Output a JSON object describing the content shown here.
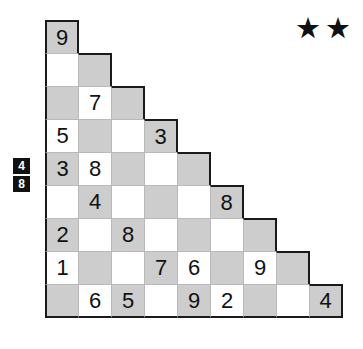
{
  "puzzle": {
    "type": "triangular-number-grid",
    "shape": "right-triangle-staircase",
    "rows": 9,
    "difficulty": {
      "stars_count": 2,
      "star_glyph": "★"
    },
    "clue": {
      "label": "left-edge-clue",
      "values": [
        "4",
        "8"
      ]
    },
    "colors": {
      "shaded_cell": "#cdcdcd",
      "empty_cell": "#ffffff",
      "grid_line": "#b9b9b9",
      "outline": "#1a1a1a",
      "digit": "#111111",
      "clue_background": "#111111",
      "clue_text": "#ffffff"
    },
    "grid": [
      [
        {
          "v": "9",
          "s": true
        }
      ],
      [
        {
          "v": "",
          "s": false
        },
        {
          "v": "",
          "s": true
        }
      ],
      [
        {
          "v": "",
          "s": true
        },
        {
          "v": "7",
          "s": false
        },
        {
          "v": "",
          "s": true
        }
      ],
      [
        {
          "v": "5",
          "s": false
        },
        {
          "v": "",
          "s": true
        },
        {
          "v": "",
          "s": false
        },
        {
          "v": "3",
          "s": true
        }
      ],
      [
        {
          "v": "3",
          "s": true
        },
        {
          "v": "8",
          "s": false
        },
        {
          "v": "",
          "s": true
        },
        {
          "v": "",
          "s": false
        },
        {
          "v": "",
          "s": true
        }
      ],
      [
        {
          "v": "",
          "s": false
        },
        {
          "v": "4",
          "s": true
        },
        {
          "v": "",
          "s": false
        },
        {
          "v": "",
          "s": true
        },
        {
          "v": "",
          "s": false
        },
        {
          "v": "8",
          "s": true
        }
      ],
      [
        {
          "v": "2",
          "s": true
        },
        {
          "v": "",
          "s": false
        },
        {
          "v": "8",
          "s": true
        },
        {
          "v": "",
          "s": false
        },
        {
          "v": "",
          "s": true
        },
        {
          "v": "",
          "s": false
        },
        {
          "v": "",
          "s": true
        }
      ],
      [
        {
          "v": "1",
          "s": false
        },
        {
          "v": "",
          "s": true
        },
        {
          "v": "",
          "s": false
        },
        {
          "v": "7",
          "s": true
        },
        {
          "v": "6",
          "s": false
        },
        {
          "v": "",
          "s": true
        },
        {
          "v": "9",
          "s": false
        },
        {
          "v": "",
          "s": true
        }
      ],
      [
        {
          "v": "",
          "s": true
        },
        {
          "v": "6",
          "s": false
        },
        {
          "v": "5",
          "s": true
        },
        {
          "v": "",
          "s": false
        },
        {
          "v": "9",
          "s": true
        },
        {
          "v": "2",
          "s": false
        },
        {
          "v": "",
          "s": true
        },
        {
          "v": "",
          "s": false
        },
        {
          "v": "4",
          "s": true
        }
      ]
    ]
  }
}
